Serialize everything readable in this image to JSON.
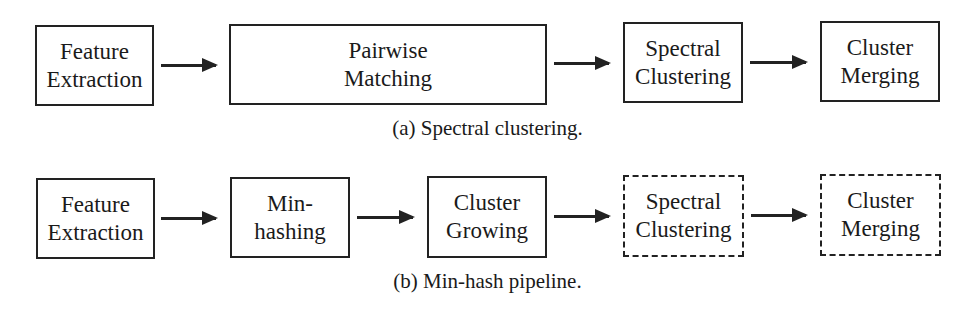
{
  "diagram_a": {
    "caption": "(a) Spectral clustering.",
    "nodes": [
      {
        "line1": "Feature",
        "line2": "Extraction",
        "style": "solid"
      },
      {
        "line1": "Pairwise",
        "line2": "Matching",
        "style": "solid"
      },
      {
        "line1": "Spectral",
        "line2": "Clustering",
        "style": "solid"
      },
      {
        "line1": "Cluster",
        "line2": "Merging",
        "style": "solid"
      }
    ]
  },
  "diagram_b": {
    "caption": "(b) Min-hash pipeline.",
    "nodes": [
      {
        "line1": "Feature",
        "line2": "Extraction",
        "style": "solid"
      },
      {
        "line1": "Min-",
        "line2": "hashing",
        "style": "solid"
      },
      {
        "line1": "Cluster",
        "line2": "Growing",
        "style": "solid"
      },
      {
        "line1": "Spectral",
        "line2": "Clustering",
        "style": "dashed"
      },
      {
        "line1": "Cluster",
        "line2": "Merging",
        "style": "dashed"
      }
    ]
  }
}
